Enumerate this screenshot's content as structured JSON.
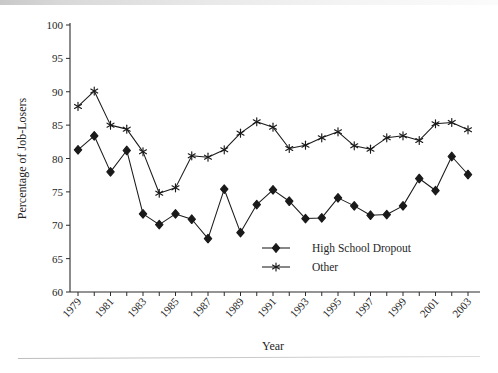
{
  "chart_data": {
    "type": "line",
    "title": "",
    "xlabel": "Year",
    "ylabel": "Percentage of Job-Losers",
    "xlim": [
      1979,
      2003
    ],
    "ylim": [
      60,
      100
    ],
    "ytick_step": 5,
    "yticks": [
      60,
      65,
      70,
      75,
      80,
      85,
      90,
      95,
      100
    ],
    "xticks": [
      1979,
      1980,
      1981,
      1982,
      1983,
      1984,
      1985,
      1986,
      1987,
      1988,
      1989,
      1990,
      1991,
      1992,
      1993,
      1994,
      1995,
      1996,
      1997,
      1998,
      1999,
      2000,
      2001,
      2002,
      2003
    ],
    "xtick_labels": [
      "1979",
      "",
      "1981",
      "",
      "1983",
      "",
      "1985",
      "",
      "1987",
      "",
      "1989",
      "",
      "1991",
      "",
      "1993",
      "",
      "1995",
      "",
      "1997",
      "",
      "1999",
      "",
      "2001",
      "",
      "2003"
    ],
    "x": [
      1979,
      1980,
      1981,
      1982,
      1983,
      1984,
      1985,
      1986,
      1987,
      1988,
      1989,
      1990,
      1991,
      1992,
      1993,
      1994,
      1995,
      1996,
      1997,
      1998,
      1999,
      2000,
      2001,
      2002,
      2003
    ],
    "grid": false,
    "legend_position": "inside-bottom-center",
    "series": [
      {
        "name": "High School Dropout",
        "marker": "diamond",
        "color": "#1a1a1a",
        "values": [
          81.3,
          83.4,
          78.0,
          81.2,
          71.7,
          70.1,
          71.7,
          70.9,
          68.0,
          75.4,
          68.9,
          73.1,
          75.3,
          73.6,
          71.0,
          71.1,
          74.1,
          72.9,
          71.5,
          71.6,
          72.9,
          77.0,
          75.2,
          80.3,
          77.6
        ]
      },
      {
        "name": "Other",
        "marker": "asterisk",
        "color": "#1a1a1a",
        "values": [
          87.8,
          90.1,
          85.0,
          84.4,
          81.0,
          74.8,
          75.6,
          80.4,
          80.2,
          81.3,
          83.8,
          85.5,
          84.7,
          81.5,
          82.0,
          83.1,
          84.0,
          81.9,
          81.4,
          83.1,
          83.4,
          82.7,
          85.2,
          85.4,
          84.3
        ]
      }
    ]
  },
  "legend": {
    "items": [
      {
        "label": "High School Dropout",
        "marker": "diamond"
      },
      {
        "label": "Other",
        "marker": "asterisk"
      }
    ]
  }
}
